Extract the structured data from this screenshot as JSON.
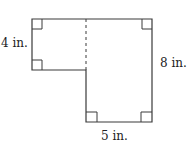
{
  "diagram": {
    "type": "composite-rectangle-figure",
    "stroke_color": "#3a3a3a",
    "labels": {
      "left_height": "4 in.",
      "right_height": "8 in.",
      "bottom_width": "5 in."
    },
    "shapes": [
      {
        "name": "upper-left-rectangle",
        "height_in": 4
      },
      {
        "name": "right-rectangle",
        "height_in": 8,
        "width_in": 5
      }
    ],
    "right_angle_markers": 6,
    "dashed_divider": true
  }
}
